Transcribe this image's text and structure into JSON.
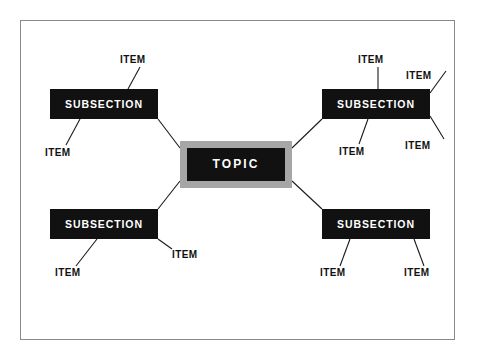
{
  "diagram": {
    "type": "mind-map",
    "title_node": {
      "label": "TOPIC",
      "fill": "#111111",
      "frame_fill": "#a6a6a6",
      "text_color": "#ffffff"
    },
    "frame_border_color": "#8a8a8a",
    "background": "#ffffff",
    "connector_color": "#1a1a1a",
    "subsections": [
      {
        "id": "subsection-top-left",
        "label": "SUBSECTION",
        "items": [
          {
            "id": "item-tl-1",
            "label": "ITEM"
          },
          {
            "id": "item-tl-2",
            "label": "ITEM"
          }
        ]
      },
      {
        "id": "subsection-top-right",
        "label": "SUBSECTION",
        "items": [
          {
            "id": "item-tr-1",
            "label": "ITEM"
          },
          {
            "id": "item-tr-2",
            "label": "ITEM"
          },
          {
            "id": "item-tr-3",
            "label": "ITEM"
          },
          {
            "id": "item-tr-4",
            "label": "ITEM"
          }
        ]
      },
      {
        "id": "subsection-bottom-left",
        "label": "SUBSECTION",
        "items": [
          {
            "id": "item-bl-1",
            "label": "ITEM"
          },
          {
            "id": "item-bl-2",
            "label": "ITEM"
          }
        ]
      },
      {
        "id": "subsection-bottom-right",
        "label": "SUBSECTION",
        "items": [
          {
            "id": "item-br-1",
            "label": "ITEM"
          },
          {
            "id": "item-br-2",
            "label": "ITEM"
          }
        ]
      }
    ]
  }
}
